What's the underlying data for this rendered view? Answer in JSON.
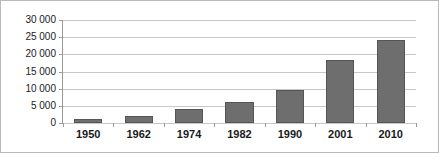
{
  "chart_data": {
    "type": "bar",
    "title": "",
    "subtitle": "",
    "xlabel": "",
    "ylabel": "",
    "categories": [
      "1950",
      "1962",
      "1974",
      "1982",
      "1990",
      "2001",
      "2010"
    ],
    "values": [
      1200,
      2100,
      4000,
      6100,
      9700,
      18400,
      24300
    ],
    "series": [
      {
        "name": "",
        "values": [
          1200,
          2100,
          4000,
          6100,
          9700,
          18400,
          24300
        ]
      }
    ],
    "ylim": [
      0,
      30000
    ],
    "ytick_values": [
      0,
      5000,
      10000,
      15000,
      20000,
      25000,
      30000
    ],
    "ytick_labels": [
      "0",
      "5 000",
      "10 000",
      "15 000",
      "20 000",
      "25 000",
      "30 000"
    ],
    "grid": true,
    "grid_axis": "y",
    "legend": false,
    "legend_position": "none",
    "annotations": [],
    "colors": {
      "bar_fill": "#6e6e6e",
      "bar_border": "#555555",
      "gridline": "#c8c8c8",
      "axis_line": "#9a9a9a",
      "frame_border": "#b9b9b9",
      "text": "#1a1a1a",
      "background": "#ffffff"
    }
  }
}
